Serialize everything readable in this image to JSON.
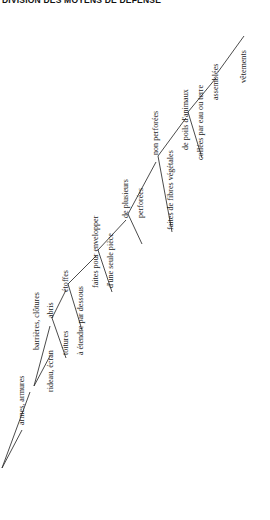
{
  "title": "DIVISION DES MOYENS DE DÉFENSE",
  "diagram": {
    "type": "tree",
    "orientation": "rotated-90-counterclockwise",
    "nodes": [
      {
        "id": "n1",
        "label": "armes, armures",
        "x": 18,
        "y": 425,
        "depth": 1
      },
      {
        "id": "n2",
        "label": "barrières, clôtures",
        "x": 33,
        "y": 350,
        "depth": 1
      },
      {
        "id": "n3",
        "label": "rideau, écran",
        "x": 47,
        "y": 392,
        "depth": 2
      },
      {
        "id": "n4",
        "label": "abris",
        "x": 47,
        "y": 318,
        "depth": 2
      },
      {
        "id": "n5",
        "label": "toitures",
        "x": 62,
        "y": 355,
        "depth": 3
      },
      {
        "id": "n6",
        "label": "étoffes",
        "x": 62,
        "y": 292,
        "depth": 3
      },
      {
        "id": "n7",
        "label": "à étendre par dessous",
        "x": 77,
        "y": 355,
        "depth": 4
      },
      {
        "id": "n8",
        "label": "faites pour envelopper",
        "x": 92,
        "y": 288,
        "depth": 4
      },
      {
        "id": "n9",
        "label": "d'une seule pièce",
        "x": 107,
        "y": 288,
        "depth": 5
      },
      {
        "id": "n10",
        "label": "de plusieurs",
        "x": 122,
        "y": 218,
        "depth": 5
      },
      {
        "id": "n11",
        "label": "perforées",
        "x": 137,
        "y": 218,
        "depth": 6
      },
      {
        "id": "n12",
        "label": "non perforées",
        "x": 152,
        "y": 155,
        "depth": 6
      },
      {
        "id": "n13",
        "label": "faites de fibres végétales",
        "x": 167,
        "y": 230,
        "depth": 7
      },
      {
        "id": "n14",
        "label": "de poils d'animaux",
        "x": 182,
        "y": 150,
        "depth": 7
      },
      {
        "id": "n15",
        "label": "collées par eau ou terre",
        "x": 197,
        "y": 160,
        "depth": 8
      },
      {
        "id": "n16",
        "label": "assemblées",
        "x": 212,
        "y": 100,
        "depth": 8
      },
      {
        "id": "n17",
        "label": "vêtements",
        "x": 240,
        "y": 83,
        "depth": 9
      }
    ],
    "links": [
      "M 2,468 L 22,430",
      "M 2,468 L 30,392",
      "M 34,386 L 50,356",
      "M 34,386 L 50,326",
      "M 52,318 L 66,358",
      "M 52,318 L 66,290",
      "M 68,284 L 82,330",
      "M 68,284 L 96,256",
      "M 98,250 L 112,292",
      "M 98,250 L 126,220",
      "M 128,214 L 142,244",
      "M 128,214 L 156,162",
      "M 158,156 L 172,232",
      "M 158,156 L 186,118",
      "M 188,112 L 202,158",
      "M 188,112 L 216,78",
      "M 218,72 L 244,36"
    ],
    "style": {
      "stroke": "#2b2b2b",
      "background": "#ffffff",
      "text_color": "#1b1b1b"
    }
  }
}
